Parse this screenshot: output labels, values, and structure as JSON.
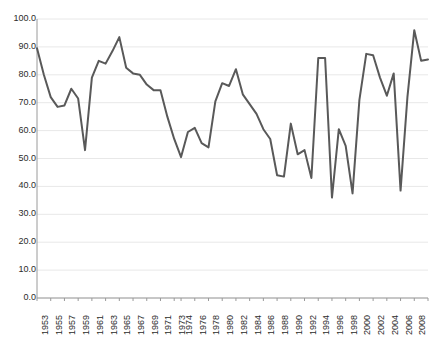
{
  "chart_data": {
    "type": "line",
    "title": "",
    "subtitle": "",
    "xlabel": "",
    "ylabel": "",
    "legend": [],
    "grid": true,
    "grid_axis": "y",
    "legend_position": "none",
    "line_color": "#595959",
    "axis_color": "#9a9a9a",
    "grid_color": "#e8e8e8",
    "background_color": "#ffffff",
    "ylim": [
      0.0,
      100.0
    ],
    "ytick_labels": [
      "100.0",
      "90.0",
      "80.0",
      "70.0",
      "60.0",
      "50.0",
      "40.0",
      "30.0",
      "20.0",
      "10.0",
      "0.0"
    ],
    "ytick_values": [
      100.0,
      90.0,
      80.0,
      70.0,
      60.0,
      50.0,
      40.0,
      30.0,
      20.0,
      10.0,
      0.0
    ],
    "xtick_labels": [
      "1953",
      "1955",
      "1957",
      "1959",
      "1961",
      "1963",
      "1965",
      "1967",
      "1969",
      "1971",
      "1973",
      "1974",
      "1976",
      "1978",
      "1980",
      "1982",
      "1984",
      "1986",
      "1988",
      "1990",
      "1992",
      "1994",
      "1996",
      "1998",
      "2000",
      "2002",
      "2004",
      "2006",
      "2008",
      "2010"
    ],
    "x": [
      1953,
      1954,
      1955,
      1956,
      1957,
      1958,
      1959,
      1960,
      1961,
      1962,
      1963,
      1964,
      1965,
      1966,
      1967,
      1968,
      1969,
      1970,
      1971,
      1972,
      1973,
      1974,
      1975,
      1976,
      1977,
      1978,
      1979,
      1980,
      1981,
      1982,
      1983,
      1984,
      1985,
      1986,
      1987,
      1988,
      1989,
      1990,
      1991,
      1992,
      1993,
      1994,
      1995,
      1996,
      1997,
      1998,
      1999,
      2000,
      2001,
      2002,
      2003,
      2004,
      2005,
      2006,
      2007,
      2008,
      2009,
      2010
    ],
    "values": [
      89.5,
      80.0,
      72.0,
      68.5,
      69.0,
      75.0,
      71.5,
      53.0,
      79.0,
      85.0,
      84.0,
      88.5,
      93.5,
      82.5,
      80.5,
      80.0,
      76.5,
      74.5,
      74.5,
      65.0,
      57.0,
      50.5,
      59.5,
      61.0,
      55.5,
      54.0,
      70.5,
      77.0,
      76.0,
      82.0,
      73.0,
      69.5,
      66.0,
      60.5,
      57.0,
      44.0,
      43.5,
      62.5,
      51.5,
      53.0,
      43.0,
      86.0,
      86.0,
      36.0,
      60.5,
      54.5,
      37.5,
      71.0,
      87.5,
      87.0,
      79.0,
      72.5,
      80.5,
      38.5,
      72.0,
      96.0,
      85.0,
      85.5
    ],
    "series": [
      {
        "name": "series-1",
        "values": [
          89.5,
          80.0,
          72.0,
          68.5,
          69.0,
          75.0,
          71.5,
          53.0,
          79.0,
          85.0,
          84.0,
          88.5,
          93.5,
          82.5,
          80.5,
          80.0,
          76.5,
          74.5,
          74.5,
          65.0,
          57.0,
          50.5,
          59.5,
          61.0,
          55.5,
          54.0,
          70.5,
          77.0,
          76.0,
          82.0,
          73.0,
          69.5,
          66.0,
          60.5,
          57.0,
          44.0,
          43.5,
          62.5,
          51.5,
          53.0,
          43.0,
          86.0,
          86.0,
          36.0,
          60.5,
          54.5,
          37.5,
          71.0,
          87.5,
          87.0,
          79.0,
          72.5,
          80.5,
          38.5,
          72.0,
          96.0,
          85.0,
          85.5
        ]
      }
    ]
  }
}
